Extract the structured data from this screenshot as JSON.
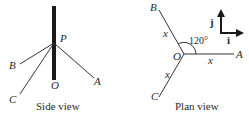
{
  "side_view": {
    "caption": "Side view",
    "labels": {
      "P": "P",
      "O": "O",
      "A": "A",
      "B": "B",
      "C": "C"
    }
  },
  "plan_view": {
    "caption": "Plan view",
    "labels": {
      "O": "O",
      "A": "A",
      "B": "B",
      "C": "C"
    },
    "lengths": {
      "OA": "x",
      "OB": "x",
      "OC": "x"
    },
    "angle": "120°",
    "unit_vectors": {
      "i": "i",
      "j": "j"
    }
  }
}
